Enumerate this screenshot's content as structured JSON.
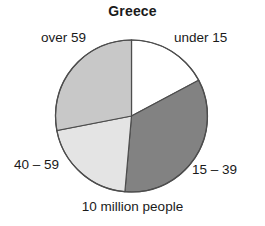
{
  "chart_data": {
    "type": "pie",
    "title": "Greece",
    "caption": "10 million people",
    "xlabel": "",
    "ylabel": "",
    "legend_position": "outside-labels",
    "grid": false,
    "total_label": "10 million people",
    "categories": [
      "under 15",
      "15 – 39",
      "40 – 59",
      "over 59"
    ],
    "values": [
      17.2,
      34.2,
      20.6,
      28.0
    ],
    "start_angle_deg": 0,
    "direction": "clockwise",
    "slices": [
      {
        "label": "under 15",
        "value": 17.2,
        "color": "#ffffff",
        "start_angle_deg": 0,
        "end_angle_deg": 62,
        "label_x": 174,
        "label_y": 30
      },
      {
        "label": "15 – 39",
        "value": 34.2,
        "color": "#828282",
        "start_angle_deg": 62,
        "end_angle_deg": 185,
        "label_x": 192,
        "label_y": 162
      },
      {
        "label": "40 – 59",
        "value": 20.6,
        "color": "#e4e4e4",
        "start_angle_deg": 185,
        "end_angle_deg": 259,
        "label_x": 14,
        "label_y": 157
      },
      {
        "label": "over 59",
        "value": 28.0,
        "color": "#c8c8c8",
        "start_angle_deg": 259,
        "end_angle_deg": 360,
        "label_x": 41,
        "label_y": 30
      }
    ],
    "geometry": {
      "center_x": 131.5,
      "center_y": 116,
      "radius": 76
    },
    "colors": {
      "outline": "#4d4d4d",
      "text": "#1a1a1a",
      "background": "#ffffff"
    }
  }
}
